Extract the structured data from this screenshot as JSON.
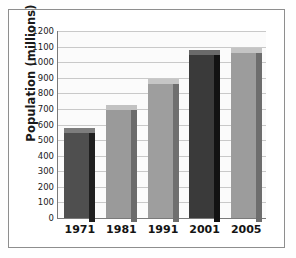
{
  "chart_data": {
    "type": "bar",
    "title": "",
    "xlabel": "",
    "ylabel": "Population (millions)",
    "categories": [
      "1971",
      "1981",
      "1991",
      "2001",
      "2005"
    ],
    "values": [
      548,
      690,
      860,
      1045,
      1060
    ],
    "ylim": [
      0,
      1200
    ],
    "ytick_step": 100,
    "yticks": [
      "1200",
      "1100",
      "1000",
      "900",
      "800",
      "700",
      "600",
      "500",
      "400",
      "300",
      "200",
      "100",
      "0"
    ],
    "grid": true,
    "legend": "none",
    "bar_colors": [
      "#4f4f4f",
      "#9a9a9a",
      "#9e9e9e",
      "#3a3a3a",
      "#9c9c9c"
    ],
    "bar_side_colors": [
      "#1f1f1f",
      "#6b6b6b",
      "#6f6f6f",
      "#121212",
      "#6d6d6d"
    ],
    "bar_top_colors": [
      "#7d7d7d",
      "#c2c2c2",
      "#c6c6c6",
      "#6a6a6a",
      "#c4c4c4"
    ],
    "style": "3d-extruded",
    "background": "#fbfbfb",
    "axis_color": "#7a7a7a",
    "gridline_color": "#c9c9c9"
  }
}
